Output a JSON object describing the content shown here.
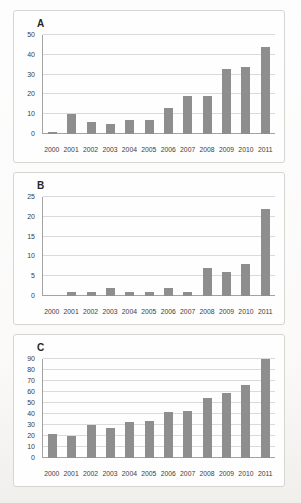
{
  "figure": {
    "bar_color": "#8e8e8e",
    "gridline_color": "#dadada",
    "axis_color": "#a3a3a3",
    "text_color": "#3d3d3d",
    "panel_background": "#fefefe",
    "panel_border_color": "#d6d5d2"
  },
  "chart_data": [
    {
      "type": "bar",
      "title": "A",
      "categories": [
        "2000",
        "2001",
        "2002",
        "2003",
        "2004",
        "2005",
        "2006",
        "2007",
        "2008",
        "2009",
        "2010",
        "2011"
      ],
      "values": [
        1,
        10,
        6,
        5,
        7,
        7,
        13,
        19,
        19,
        33,
        34,
        44
      ],
      "xlabel": "",
      "ylabel": "",
      "ylim": [
        0,
        50
      ],
      "ytick_step": 10,
      "yticks": [
        0,
        10,
        20,
        30,
        40,
        50
      ],
      "grid": true,
      "legend": false,
      "bar_color": "#8e8e8e"
    },
    {
      "type": "bar",
      "title": "B",
      "categories": [
        "2000",
        "2001",
        "2002",
        "2003",
        "2004",
        "2005",
        "2006",
        "2007",
        "2008",
        "2009",
        "2010",
        "2011"
      ],
      "values": [
        0,
        1,
        1,
        2,
        1,
        1,
        2,
        1,
        7,
        6,
        8,
        22
      ],
      "xlabel": "",
      "ylabel": "",
      "ylim": [
        0,
        25
      ],
      "ytick_step": 5,
      "yticks": [
        0,
        5,
        10,
        15,
        20,
        25
      ],
      "grid": true,
      "legend": false,
      "bar_color": "#8e8e8e"
    },
    {
      "type": "bar",
      "title": "C",
      "categories": [
        "2000",
        "2001",
        "2002",
        "2003",
        "2004",
        "2005",
        "2006",
        "2007",
        "2008",
        "2009",
        "2010",
        "2011"
      ],
      "values": [
        22,
        20,
        30,
        27,
        33,
        34,
        42,
        43,
        55,
        59,
        66,
        90
      ],
      "xlabel": "",
      "ylabel": "",
      "ylim": [
        0,
        90
      ],
      "ytick_step": 10,
      "yticks": [
        0,
        10,
        20,
        30,
        40,
        50,
        60,
        70,
        80,
        90
      ],
      "grid": true,
      "legend": false,
      "bar_color": "#8e8e8e"
    }
  ]
}
